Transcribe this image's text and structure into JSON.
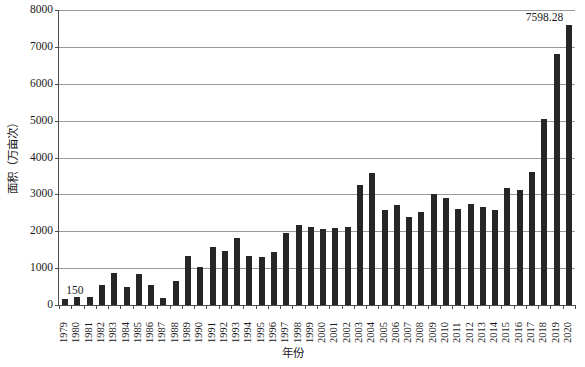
{
  "chart_data": {
    "type": "bar",
    "title": "",
    "xlabel": "年份",
    "ylabel": "面积（万亩次）",
    "ylim": [
      0,
      8000
    ],
    "ytick_step": 1000,
    "yticks": [
      "0",
      "1000",
      "2000",
      "3000",
      "4000",
      "5000",
      "6000",
      "7000",
      "8000"
    ],
    "grid": "horizontal",
    "legend": "none",
    "bar_color": "#262626",
    "categories": [
      "1979",
      "1980",
      "1981",
      "1982",
      "1983",
      "1984",
      "1985",
      "1986",
      "1987",
      "1988",
      "1989",
      "1990",
      "1991",
      "1992",
      "1993",
      "1994",
      "1995",
      "1996",
      "1997",
      "1998",
      "1999",
      "2000",
      "2001",
      "2002",
      "2003",
      "2004",
      "2005",
      "2006",
      "2007",
      "2008",
      "2009",
      "2010",
      "2011",
      "2012",
      "2013",
      "2014",
      "2015",
      "2016",
      "2017",
      "2018",
      "2019",
      "2020"
    ],
    "values": [
      150,
      230,
      220,
      540,
      880,
      500,
      840,
      540,
      200,
      640,
      1340,
      1020,
      1560,
      1460,
      1810,
      1330,
      1300,
      1440,
      1950,
      2180,
      2110,
      2070,
      2100,
      2110,
      3250,
      3570,
      2580,
      2720,
      2400,
      2530,
      3010,
      2890,
      2600,
      2740,
      2670,
      2580,
      3180,
      3130,
      3610,
      5050,
      6800,
      7598.28
    ],
    "data_labels": [
      {
        "category": "1979",
        "value": 150,
        "text": "150"
      },
      {
        "category": "2020",
        "value": 7598.28,
        "text": "7598.28"
      }
    ]
  }
}
